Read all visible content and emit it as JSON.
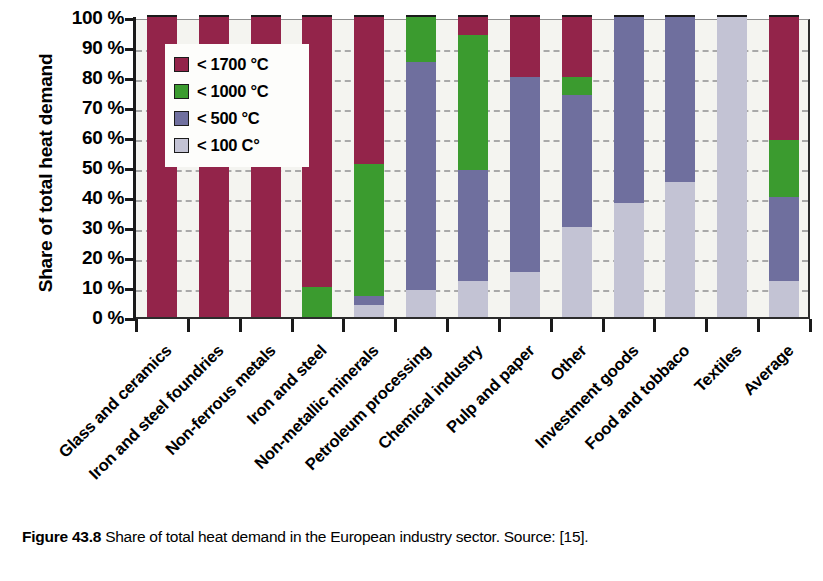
{
  "figure": {
    "caption_label": "Figure 43.8",
    "caption_text": "Share of total heat demand in the European industry sector. Source: [15]."
  },
  "chart_data": {
    "type": "bar",
    "subtype": "stacked-bar-100-percent",
    "title": "",
    "xlabel": "",
    "ylabel": "Share of total heat demand",
    "ylim": [
      0,
      100
    ],
    "yticks": [
      0,
      10,
      20,
      30,
      40,
      50,
      60,
      70,
      80,
      90,
      100
    ],
    "ytick_labels": [
      "0 %",
      "10 %",
      "20 %",
      "30 %",
      "40 %",
      "50 %",
      "60 %",
      "70 %",
      "80 %",
      "90 %",
      "100 %"
    ],
    "grid": "horizontal-dashed",
    "legend_position": "upper-left-inside",
    "categories": [
      "Glass and ceramics",
      "Iron and steel foundries",
      "Non-ferrous metals",
      "Iron and steel",
      "Non-metallic minerals",
      "Petroleum processing",
      "Chemical industry",
      "Pulp and paper",
      "Other",
      "Investment goods",
      "Food and tobbaco",
      "Textiles",
      "Average"
    ],
    "series": [
      {
        "name": "< 100 C°",
        "color": "#c3c3d4",
        "values": [
          0,
          0,
          0,
          0,
          4,
          9,
          12,
          15,
          30,
          38,
          45,
          100,
          12
        ]
      },
      {
        "name": "< 500 °C",
        "color": "#6f6f9e",
        "values": [
          0,
          0,
          0,
          0,
          3,
          76,
          37,
          65,
          44,
          62,
          55,
          0,
          28
        ]
      },
      {
        "name": "< 1000 °C",
        "color": "#3b9b2f",
        "values": [
          0,
          0,
          0,
          10,
          44,
          15,
          45,
          0,
          6,
          0,
          0,
          0,
          19
        ]
      },
      {
        "name": "< 1700 °C",
        "color": "#93244a",
        "values": [
          100,
          100,
          100,
          90,
          49,
          0,
          6,
          20,
          20,
          0,
          0,
          0,
          41
        ]
      }
    ],
    "stack_order_bottom_to_top": [
      "< 100 C°",
      "< 500 °C",
      "< 1000 °C",
      "< 1700 °C"
    ]
  },
  "legend": {
    "items": [
      {
        "label": "< 1700 °C",
        "color": "#93244a"
      },
      {
        "label": "< 1000 °C",
        "color": "#3b9b2f"
      },
      {
        "label": "< 500 °C",
        "color": "#6f6f9e"
      },
      {
        "label": "< 100 C°",
        "color": "#c3c3d4"
      }
    ]
  },
  "colors": {
    "axis": "#1a1a1a",
    "gridline": "#a9a9a9",
    "plot_background": "#f4f4f0",
    "page_background": "#ffffff"
  }
}
